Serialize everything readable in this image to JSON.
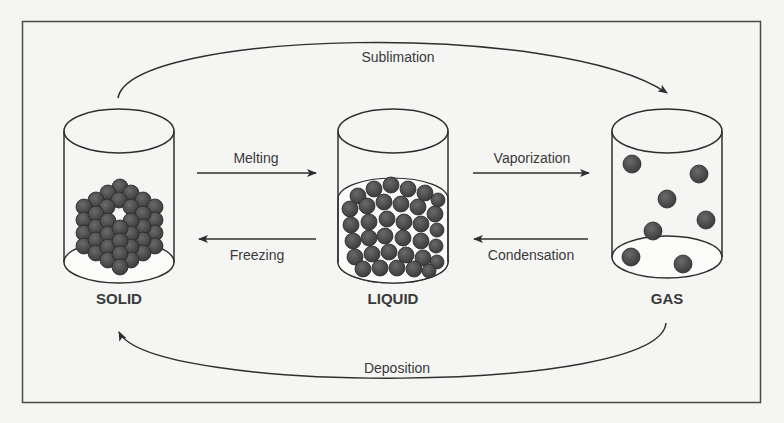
{
  "diagram": {
    "colors": {
      "background": "#f5f5f3",
      "frame": "#4a4a4a",
      "stroke": "#2e2e2e",
      "particle": "#4d4d4d",
      "text": "#3a3a3a"
    },
    "states": [
      {
        "id": "solid",
        "label": "SOLID"
      },
      {
        "id": "liquid",
        "label": "LIQUID"
      },
      {
        "id": "gas",
        "label": "GAS"
      }
    ],
    "transitions": [
      {
        "id": "sublimation",
        "label": "Sublimation",
        "from": "solid",
        "to": "gas"
      },
      {
        "id": "melting",
        "label": "Melting",
        "from": "solid",
        "to": "liquid"
      },
      {
        "id": "freezing",
        "label": "Freezing",
        "from": "liquid",
        "to": "solid"
      },
      {
        "id": "vaporization",
        "label": "Vaporization",
        "from": "liquid",
        "to": "gas"
      },
      {
        "id": "condensation",
        "label": "Condensation",
        "from": "gas",
        "to": "liquid"
      },
      {
        "id": "deposition",
        "label": "Deposition",
        "from": "gas",
        "to": "solid"
      }
    ]
  }
}
